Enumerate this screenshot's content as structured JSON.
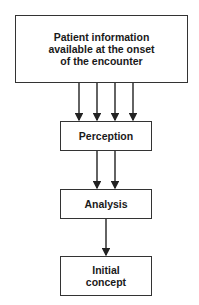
{
  "diagram": {
    "nodes": [
      {
        "id": "patient-info",
        "label": "Patient information available at the onset of the encounter",
        "lines": [
          "Patient information",
          "available at the onset",
          "of the encounter"
        ]
      },
      {
        "id": "perception",
        "label": "Perception"
      },
      {
        "id": "analysis",
        "label": "Analysis"
      },
      {
        "id": "initial-concept",
        "label": "Initial concept",
        "lines": [
          "Initial",
          "concept"
        ]
      }
    ],
    "edges": [
      {
        "from": "patient-info",
        "to": "perception",
        "count": 4
      },
      {
        "from": "perception",
        "to": "analysis",
        "count": 2
      },
      {
        "from": "analysis",
        "to": "initial-concept",
        "count": 1
      }
    ],
    "colors": {
      "stroke": "#333333",
      "text": "#1a1a1a",
      "background": "#ffffff"
    }
  }
}
